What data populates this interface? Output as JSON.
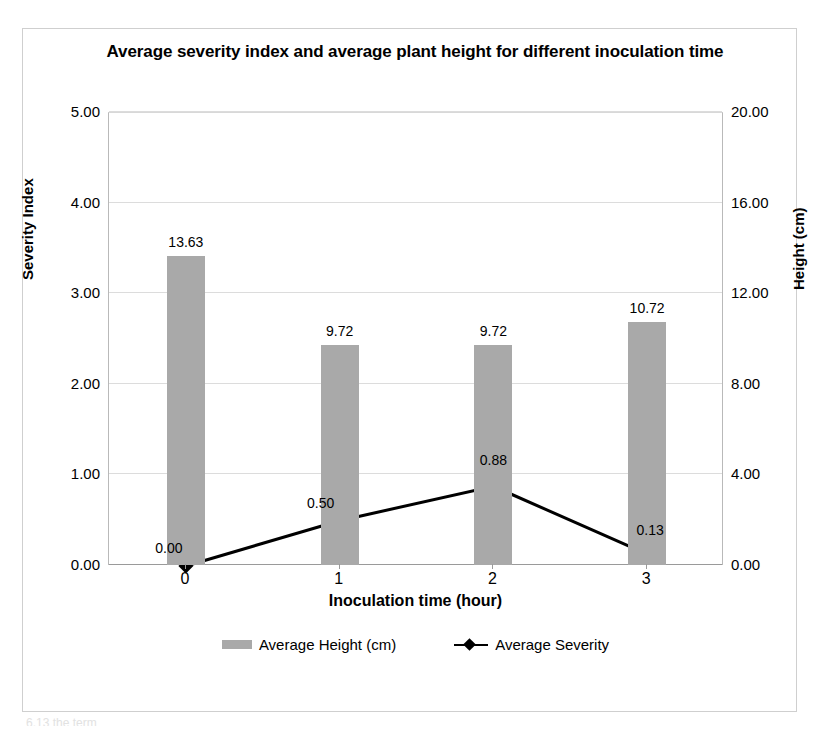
{
  "page": {
    "background_color": "#ffffff",
    "frame_border_color": "#cfcfcf",
    "scan_artifact_text": "6.13  the term"
  },
  "chart_data": {
    "type": "bar",
    "title": "Average severity index and average plant height for different inoculation time",
    "xlabel": "Inoculation time (hour)",
    "categories": [
      "0",
      "1",
      "2",
      "3"
    ],
    "grid": true,
    "legend_position": "bottom",
    "axes": {
      "left": {
        "label": "Severity Index",
        "ticks": [
          "0.00",
          "1.00",
          "2.00",
          "3.00",
          "4.00",
          "5.00"
        ],
        "min": 0,
        "max": 5,
        "step": 1
      },
      "right": {
        "label": "Height (cm)",
        "ticks": [
          "0.00",
          "4.00",
          "8.00",
          "12.00",
          "16.00",
          "20.00"
        ],
        "min": 0,
        "max": 20,
        "step": 4
      }
    },
    "series": [
      {
        "name": "Average Height (cm)",
        "type": "bar",
        "axis": "right",
        "color": "#a9a9a9",
        "values": [
          13.63,
          9.72,
          9.72,
          10.72
        ],
        "labels": [
          "13.63",
          "9.72",
          "9.72",
          "10.72"
        ]
      },
      {
        "name": "Average Severity",
        "type": "line",
        "axis": "left",
        "color": "#000000",
        "marker": "diamond",
        "values": [
          0.0,
          0.5,
          0.88,
          0.13
        ],
        "labels": [
          "0.00",
          "0.50",
          "0.88",
          "0.13"
        ]
      }
    ]
  },
  "legend": {
    "items": [
      {
        "label": "Average Height (cm)",
        "swatch": "bar-swatch"
      },
      {
        "label": "Average Severity",
        "swatch": "line-marker-swatch"
      }
    ]
  }
}
